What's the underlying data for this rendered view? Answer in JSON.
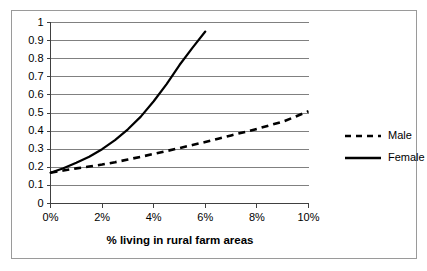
{
  "chart_data": {
    "type": "line",
    "title": "",
    "xlabel": "% living in rural farm areas",
    "ylabel": "",
    "xlim": [
      0,
      10
    ],
    "ylim": [
      0,
      1
    ],
    "grid": true,
    "grid_axis": "y",
    "legend_position": "right",
    "xticks": [
      "0%",
      "2%",
      "4%",
      "6%",
      "8%",
      "10%"
    ],
    "xtick_values": [
      0,
      2,
      4,
      6,
      8,
      10
    ],
    "yticks": [
      "0",
      "0.1",
      "0.2",
      "0.3",
      "0.4",
      "0.5",
      "0.6",
      "0.7",
      "0.8",
      "0.9",
      "1"
    ],
    "ytick_values": [
      0,
      0.1,
      0.2,
      0.3,
      0.4,
      0.5,
      0.6,
      0.7,
      0.8,
      0.9,
      1
    ],
    "series": [
      {
        "name": "Male",
        "style": "dashed",
        "color": "#000000",
        "x": [
          0,
          0.5,
          1,
          1.5,
          2,
          2.5,
          3,
          3.5,
          4,
          4.5,
          5,
          5.5,
          6,
          6.5,
          7,
          7.5,
          8,
          8.5,
          9,
          9.5,
          10
        ],
        "y": [
          0.17,
          0.182,
          0.194,
          0.204,
          0.215,
          0.228,
          0.243,
          0.258,
          0.274,
          0.29,
          0.306,
          0.323,
          0.34,
          0.358,
          0.376,
          0.394,
          0.412,
          0.432,
          0.452,
          0.48,
          0.51
        ]
      },
      {
        "name": "Female",
        "style": "solid",
        "color": "#000000",
        "x": [
          0,
          0.5,
          1,
          1.5,
          2,
          2.5,
          3,
          3.5,
          4,
          4.5,
          5,
          5.5,
          6
        ],
        "y": [
          0.17,
          0.195,
          0.225,
          0.258,
          0.3,
          0.35,
          0.41,
          0.48,
          0.565,
          0.66,
          0.765,
          0.86,
          0.95
        ]
      }
    ]
  },
  "legend": {
    "items": [
      {
        "label": "Male",
        "style": "dashed"
      },
      {
        "label": "Female",
        "style": "solid"
      }
    ]
  },
  "axis": {
    "x_title": "% living in rural farm areas"
  }
}
